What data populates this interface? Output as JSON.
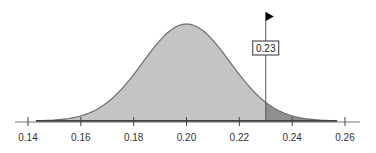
{
  "chart_data": {
    "type": "area",
    "title": "",
    "xlabel": "",
    "ylabel": "",
    "distribution": {
      "mean": 0.2,
      "sd": 0.0165
    },
    "xlim": [
      0.14,
      0.26
    ],
    "x_ticks": [
      0.14,
      0.16,
      0.18,
      0.2,
      0.22,
      0.24,
      0.26
    ],
    "x_tick_labels": [
      "0.14",
      "0.16",
      "0.18",
      "0.20",
      "0.22",
      "0.24",
      "0.26"
    ],
    "cutoff": 0.23,
    "cutoff_label": "0.23",
    "shaded_region": "right tail (x > 0.23)",
    "grid": false,
    "legend": "none",
    "colors": {
      "body_fill": "#c4c4c4",
      "tail_fill": "#8f8f8f",
      "curve_stroke": "#6e6e6e",
      "axis": "#555555",
      "marker_flag": "#000000"
    }
  }
}
